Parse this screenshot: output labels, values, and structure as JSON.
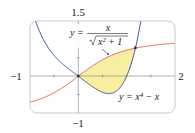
{
  "chart_data": {
    "type": "line",
    "title": "",
    "xlabel": "",
    "ylabel": "",
    "xlim": [
      -1,
      2
    ],
    "ylim": [
      -1,
      1.5
    ],
    "tick_labels": {
      "x_min": "−1",
      "x_max": "2",
      "y_min": "−1",
      "y_max": "1.5"
    },
    "grid": false,
    "series": [
      {
        "name": "y = x/√(x²+1)",
        "function": "x/sqrt(x^2+1)",
        "color": "#e0674a"
      },
      {
        "name": "y = x⁴ − x",
        "function": "x^4 - x",
        "color": "#3d57a0"
      }
    ],
    "shaded_region": {
      "between": [
        "x/sqrt(x^2+1)",
        "x^4 - x"
      ],
      "x_range": [
        0,
        1.18
      ],
      "color": "#f7eea0"
    },
    "intersection_points": [
      [
        0,
        0
      ],
      [
        1.18,
        0.763
      ]
    ],
    "annotations": [
      {
        "text": "y = x/√(x²+1)",
        "points_to": "upper curve"
      },
      {
        "text": "y = x⁴ − x",
        "points_to": "lower curve"
      }
    ]
  },
  "labels": {
    "x_min": "−1",
    "x_max": "2",
    "y_max": "1.5",
    "y_min": "−1",
    "eq1_lhs": "y =",
    "eq1_num": "x",
    "eq1_den": "x² + 1",
    "eq2": "y = x⁴ − x"
  }
}
